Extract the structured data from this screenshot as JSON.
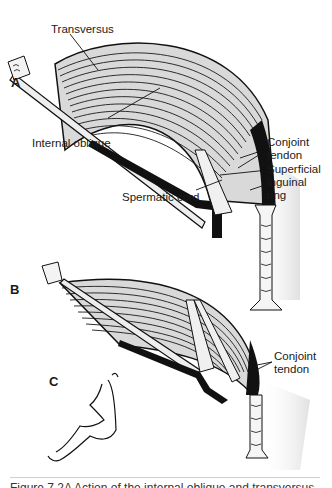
{
  "figure": {
    "panels": {
      "a": {
        "label": "A"
      },
      "b": {
        "label": "B"
      },
      "c": {
        "label": "C"
      }
    },
    "labels": {
      "transversus": "Transversus",
      "internal_oblique": "Internal oblique",
      "conjoint_tendon_a_line1": "Conjoint",
      "conjoint_tendon_a_line2": "tendon",
      "superficial_ring_line1": "Superficial",
      "superficial_ring_line2": "inguinal",
      "superficial_ring_line3": "ring",
      "spermatic_cord": "Spermatic cord",
      "conjoint_tendon_b_line1": "Conjoint",
      "conjoint_tendon_b_line2": "tendon"
    },
    "caption": "Figure 7.2A  Action of the internal oblique and transversus"
  },
  "colors": {
    "muscle_fill": "#d9d9d9",
    "fiber_stroke": "#1a1a1a",
    "cord": "#111111",
    "shadow": "#bdbdbd"
  }
}
